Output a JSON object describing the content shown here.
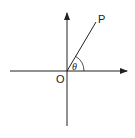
{
  "diagram": {
    "type": "polar-angle",
    "labels": {
      "point": "P",
      "origin": "O",
      "angle": "θ"
    },
    "colors": {
      "stroke": "#222222",
      "background": "#ffffff"
    }
  }
}
